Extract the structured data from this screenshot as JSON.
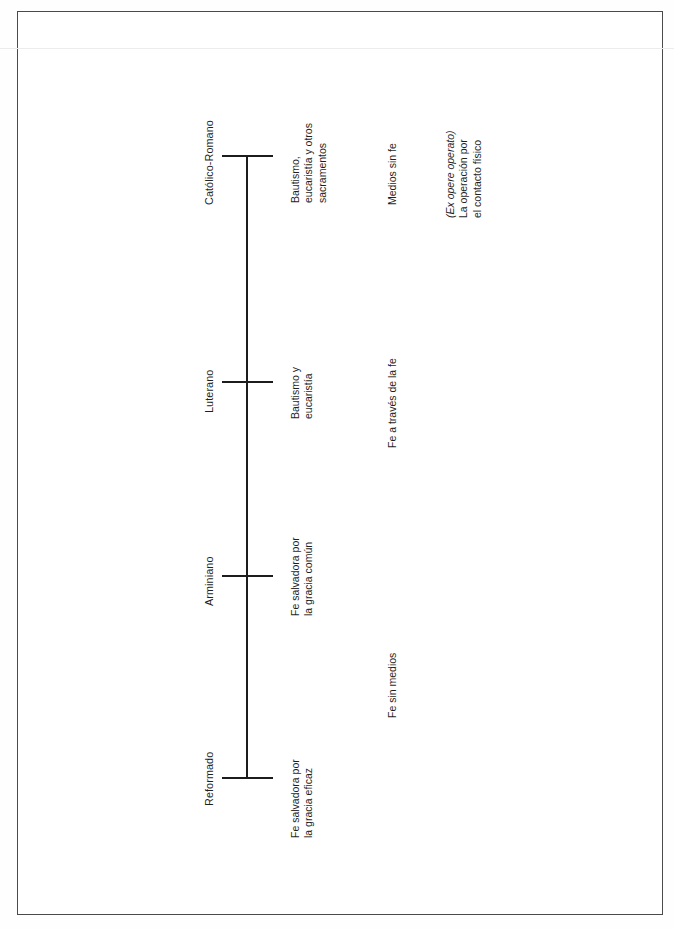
{
  "document": {
    "kind": "scanned-page-diagram",
    "orientation": "rotated-90-ccw",
    "ink_color": "#1f1f1f",
    "frame_color": "#4a4a4a",
    "page_background": "#ffffff"
  },
  "diagram": {
    "type": "spectrum-axis",
    "axis_label": "",
    "positions": [
      {
        "id": "catolico-romano",
        "name": "Católico-Romano",
        "means": [
          "Bautismo,",
          "eucaristía y otros",
          "sacramentos"
        ],
        "mode": [
          "Medios sin fe"
        ],
        "note": [
          "(Ex opere operato)",
          "La operación por",
          "el contacto físico"
        ],
        "note_italic_first_line": true
      },
      {
        "id": "luterano",
        "name": "Luterano",
        "means": [
          "Bautismo y",
          "eucaristía"
        ],
        "mode": [
          "Fe a través de la fe"
        ],
        "note": [],
        "note_italic_first_line": false
      },
      {
        "id": "arminiano",
        "name": "Arminiano",
        "means": [
          "Fe salvadora por",
          "la gracia común"
        ],
        "mode": [
          "Fe sin medios"
        ],
        "note": [],
        "note_italic_first_line": false
      },
      {
        "id": "reformado",
        "name": "Reformado",
        "means": [
          "Fe salvadora por",
          "la gracia eficaz"
        ],
        "mode": [],
        "note": [],
        "note_italic_first_line": false
      }
    ]
  },
  "labels": {
    "catolico_name": "Católico-Romano",
    "catolico_means_l1": "Bautismo,",
    "catolico_means_l2": "eucaristía y otros",
    "catolico_means_l3": "sacramentos",
    "catolico_mode": "Medios sin fe",
    "catolico_note_l1": "(Ex opere operato)",
    "catolico_note_l2": "La operación por",
    "catolico_note_l3": "el contacto físico",
    "luterano_name": "Luterano",
    "luterano_means_l1": "Bautismo y",
    "luterano_means_l2": "eucaristía",
    "luterano_mode": "Fe a través de la fe",
    "arminiano_name": "Arminiano",
    "arminiano_means_l1": "Fe salvadora por",
    "arminiano_means_l2": "la gracia común",
    "arminiano_mode": "Fe sin medios",
    "reformado_name": "Reformado",
    "reformado_means_l1": "Fe salvadora por",
    "reformado_means_l2": "la gracia eficaz"
  }
}
